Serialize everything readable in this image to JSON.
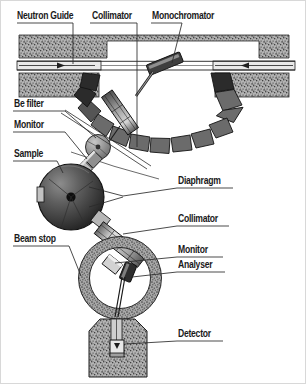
{
  "figure": {
    "background_color": "#ffffff",
    "line_color": "#1a1a1a",
    "shield_fill": "#9a9a9a",
    "arc_block_color": "#6b6b6b",
    "arc_block_dark_color": "#2b2b2b",
    "sphere_color": "#4a4a4a",
    "border_color": "#d8d8d8"
  },
  "labels": {
    "neutron_guide": "Neutron Guide",
    "collimator_top": "Collimator",
    "monochromator": "Monochromator",
    "be_filter": "Be filter",
    "monitor_left": "Monitor",
    "sample": "Sample",
    "diaphragm": "Diaphragm",
    "collimator_right": "Collimator",
    "monitor_right": "Monitor",
    "analyser": "Analyser",
    "beam_stop": "Beam stop",
    "detector": "Detector"
  },
  "components": [
    {
      "name": "neutron-guide",
      "label": "Neutron Guide",
      "side": "left"
    },
    {
      "name": "collimator-top",
      "label": "Collimator",
      "side": "top"
    },
    {
      "name": "monochromator",
      "label": "Monochromator",
      "side": "top"
    },
    {
      "name": "be-filter",
      "label": "Be filter",
      "side": "left"
    },
    {
      "name": "monitor-left",
      "label": "Monitor",
      "side": "left"
    },
    {
      "name": "sample",
      "label": "Sample",
      "side": "left"
    },
    {
      "name": "diaphragm",
      "label": "Diaphragm",
      "side": "right"
    },
    {
      "name": "collimator-right",
      "label": "Collimator",
      "side": "right"
    },
    {
      "name": "monitor-right",
      "label": "Monitor",
      "side": "right"
    },
    {
      "name": "analyser",
      "label": "Analyser",
      "side": "right"
    },
    {
      "name": "beam-stop",
      "label": "Beam stop",
      "side": "left"
    },
    {
      "name": "detector",
      "label": "Detector",
      "side": "right"
    }
  ]
}
